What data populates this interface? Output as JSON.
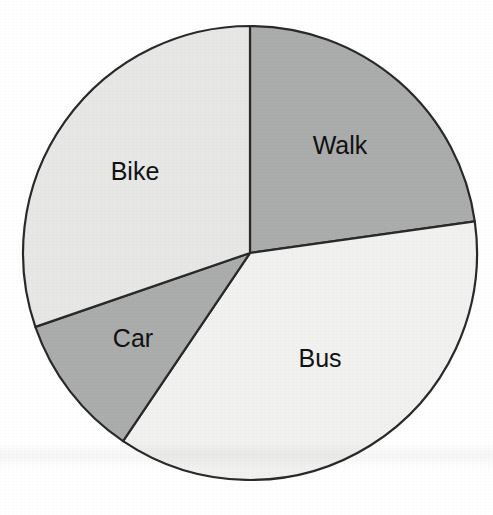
{
  "chart_data": {
    "type": "pie",
    "title": "",
    "subtitle": "",
    "xlabel": "",
    "ylabel": "",
    "legend_position": "none",
    "grid": false,
    "labels_inside_slices": true,
    "start_angle_deg": 0,
    "direction": "clockwise",
    "categories": [
      "Walk",
      "Bus",
      "Car",
      "Bike"
    ],
    "values": [
      22.8,
      36.7,
      10.3,
      30.2
    ],
    "units": "percent",
    "slices": [
      {
        "label": "Walk",
        "value": 22.8,
        "angle_deg": 82,
        "start_angle_deg": 0,
        "end_angle_deg": 82,
        "color": "#abacac",
        "label_x": 340,
        "label_y": 147
      },
      {
        "label": "Bus",
        "value": 36.7,
        "angle_deg": 132,
        "start_angle_deg": 82,
        "end_angle_deg": 214,
        "color": "#f1f1f0",
        "label_x": 320,
        "label_y": 360
      },
      {
        "label": "Car",
        "value": 10.3,
        "angle_deg": 37,
        "start_angle_deg": 214,
        "end_angle_deg": 251,
        "color": "#abacac",
        "label_x": 133,
        "label_y": 340
      },
      {
        "label": "Bike",
        "value": 30.2,
        "angle_deg": 109,
        "start_angle_deg": 251,
        "end_angle_deg": 360,
        "color": "#e7e7e6",
        "label_x": 135,
        "label_y": 173
      }
    ],
    "geometry": {
      "center_x": 250,
      "center_y": 253,
      "radius": 227
    },
    "colors": {
      "background": "#ffffff",
      "outline": "#2a2a2a",
      "label_text": "#111111",
      "medium_gray": "#abacac",
      "light_gray": "#e7e7e6",
      "near_white": "#f1f1f0"
    }
  }
}
